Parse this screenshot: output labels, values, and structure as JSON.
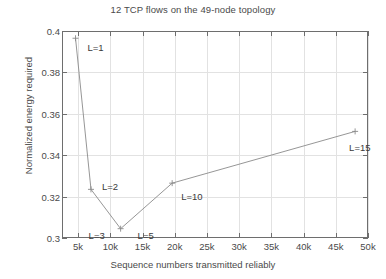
{
  "chart_data": {
    "type": "line",
    "title": "12 TCP flows on the 49-node topology",
    "xlabel": "Sequence numbers transmitted reliably",
    "ylabel": "Normalized energy required",
    "xlim": [
      2500,
      50000
    ],
    "ylim": [
      0.3,
      0.4
    ],
    "grid": true,
    "legend": "none",
    "xtick_labels": [
      "5k",
      "10k",
      "15k",
      "20k",
      "25k",
      "30k",
      "35k",
      "40k",
      "45k",
      "50k"
    ],
    "xtick_values": [
      5000,
      10000,
      15000,
      20000,
      25000,
      30000,
      35000,
      40000,
      45000,
      50000
    ],
    "ytick_labels": [
      "0.3",
      "0.32",
      "0.34",
      "0.36",
      "0.38",
      "0.4"
    ],
    "ytick_values": [
      0.3,
      0.32,
      0.34,
      0.36,
      0.38,
      0.4
    ],
    "marker": "plus",
    "line_color": "#8a8a8a",
    "series": [
      {
        "name": "normalized energy",
        "points": [
          {
            "x": 4600,
            "y": 0.3965,
            "label": "L=1",
            "label_dx": 12,
            "label_dy": 10
          },
          {
            "x": 7000,
            "y": 0.3235,
            "label": "L=2",
            "label_dx": 11,
            "label_dy": -2
          },
          {
            "x": 11600,
            "y": 0.3045,
            "label": "L=3",
            "label_dx": -32,
            "label_dy": 7
          },
          {
            "x": 11600,
            "y": 0.3045,
            "label": "L=5",
            "label_dx": 17,
            "label_dy": 7
          },
          {
            "x": 19600,
            "y": 0.3265,
            "label": "L=10",
            "label_dx": 9,
            "label_dy": 14
          },
          {
            "x": 48000,
            "y": 0.3515,
            "label": "L=15",
            "label_dx": -6,
            "label_dy": 17
          }
        ]
      }
    ]
  }
}
